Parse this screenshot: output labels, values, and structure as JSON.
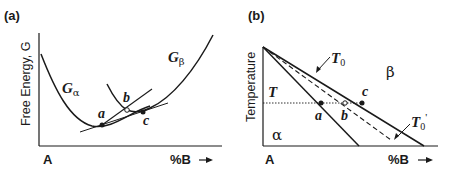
{
  "panel_a": {
    "tag": "(a)",
    "ylabel": "Free Energy, G",
    "origin_label": "A",
    "xlabel": "%B",
    "arrow": "→",
    "curve_alpha": {
      "symbol": "G",
      "subscript": "α"
    },
    "curve_beta": {
      "symbol": "G",
      "subscript": "β"
    },
    "points": {
      "a": "a",
      "b": "b",
      "c": "c"
    }
  },
  "panel_b": {
    "tag": "(b)",
    "ylabel": "Temperature",
    "origin_label": "A",
    "xlabel": "%B",
    "arrow": "→",
    "temp_label": "T",
    "t0": {
      "symbol": "T",
      "subscript": "0"
    },
    "t0_prime": {
      "symbol": "T",
      "subscript": "0",
      "prime": "'"
    },
    "phase_alpha": "α",
    "phase_beta": "β",
    "points": {
      "a": "a",
      "b": "b",
      "c": "c"
    }
  },
  "colors": {
    "line": "#1a1a1a",
    "background": "#ffffff"
  }
}
